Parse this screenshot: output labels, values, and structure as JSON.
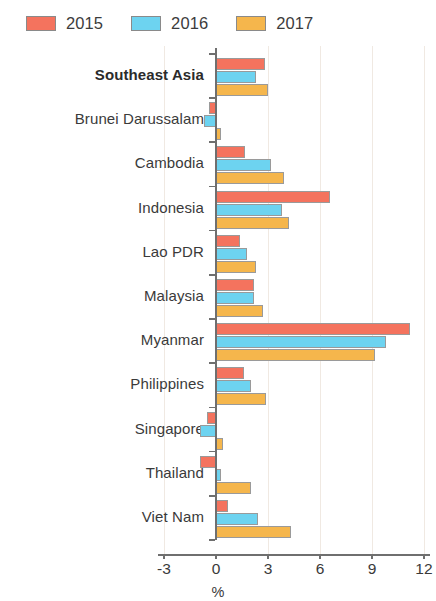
{
  "legend": {
    "items": [
      {
        "label": "2015",
        "color": "#F4735E"
      },
      {
        "label": "2016",
        "color": "#6DD3F0"
      },
      {
        "label": "2017",
        "color": "#F5B64C"
      }
    ]
  },
  "axis": {
    "ticks": [
      "-3",
      "0",
      "3",
      "6",
      "9",
      "12"
    ],
    "title": "%"
  },
  "chart_data": {
    "type": "bar",
    "orientation": "horizontal",
    "title": "",
    "xlabel": "%",
    "ylabel": "",
    "xlim": [
      -3,
      12
    ],
    "xticks": [
      -3,
      0,
      3,
      6,
      9,
      12
    ],
    "grid": false,
    "legend_position": "top-left",
    "categories": [
      "Southeast Asia",
      "Brunei Darussalam",
      "Cambodia",
      "Indonesia",
      "Lao PDR",
      "Malaysia",
      "Myanmar",
      "Philippines",
      "Singapore",
      "Thailand",
      "Viet Nam"
    ],
    "emphasized_categories": [
      "Southeast Asia"
    ],
    "series": [
      {
        "name": "2015",
        "color": "#F4735E",
        "values": [
          2.8,
          -0.4,
          1.7,
          6.6,
          1.4,
          2.2,
          11.2,
          1.6,
          -0.5,
          -0.9,
          0.7
        ]
      },
      {
        "name": "2016",
        "color": "#6DD3F0",
        "values": [
          2.3,
          -0.7,
          3.2,
          3.8,
          1.8,
          2.2,
          9.8,
          2.0,
          -0.9,
          0.3,
          2.4
        ]
      },
      {
        "name": "2017",
        "color": "#F5B64C",
        "values": [
          3.0,
          0.3,
          3.9,
          4.2,
          2.3,
          2.7,
          9.2,
          2.9,
          0.4,
          2.0,
          4.3
        ]
      }
    ]
  }
}
